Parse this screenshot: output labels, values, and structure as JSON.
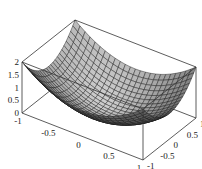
{
  "chart_data": {
    "type": "surface3d",
    "title": "",
    "function": "z = x^2 + y^2",
    "x_range": [
      -1,
      1
    ],
    "y_range": [
      -1,
      1
    ],
    "z_range": [
      0,
      2
    ],
    "grid_divisions": 24,
    "x_ticks": [
      "-1",
      "-0.5",
      "0",
      "0.5",
      "1"
    ],
    "y_ticks": [
      "-1",
      "-0.5",
      "0",
      "0.5",
      "1"
    ],
    "z_ticks": [
      "0",
      "0.5",
      "1",
      "1.5",
      "2"
    ],
    "xlabel": "",
    "ylabel": "",
    "zlabel": "",
    "box": true,
    "surface_color": "#a8a8a8",
    "mesh_color": "#1a1a1a"
  }
}
